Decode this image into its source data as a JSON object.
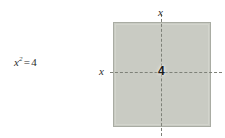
{
  "figure": {
    "type": "geometry-diagram",
    "background_color": "#ffffff"
  },
  "equation": {
    "variable": "x",
    "exponent": "2",
    "relation": "=",
    "value": "4",
    "full_text": "x² = 4",
    "color": "#2b2b2b"
  },
  "square": {
    "fill_color": "#c9cbc3",
    "border_color": "#a9aca3",
    "side_label_top": "x",
    "side_label_left": "x",
    "area_label": "4",
    "area_label_color": "#1a1a1a"
  },
  "guides": {
    "vertical_dash_label": "vertical-center-dashed-line",
    "horizontal_dash_label": "horizontal-center-dashed-line",
    "dash_color": "#7e8178"
  }
}
